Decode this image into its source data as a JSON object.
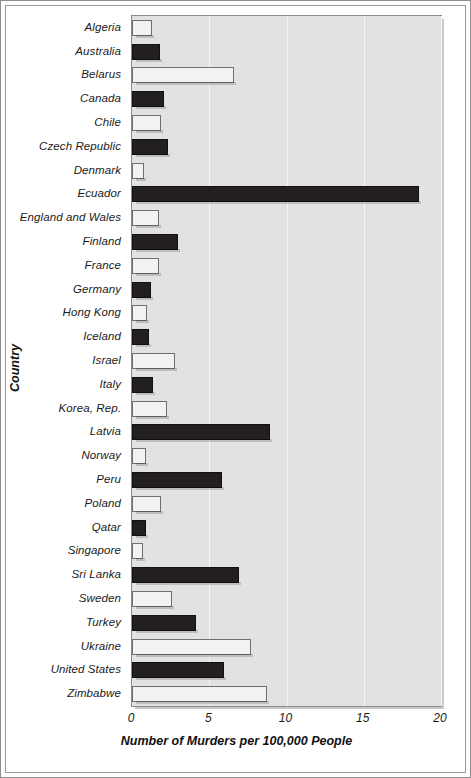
{
  "chart_data": {
    "type": "bar",
    "orientation": "horizontal",
    "title": "",
    "xlabel": "Number of Murders per 100,000 People",
    "ylabel": "Country",
    "xlim": [
      0,
      20
    ],
    "xticks": [
      0,
      5,
      10,
      15,
      20
    ],
    "xtick_labels": [
      "0",
      "5",
      "10",
      "15",
      "20"
    ],
    "grid": true,
    "grid_axis": "x",
    "legend": "none",
    "categories": [
      "Algeria",
      "Australia",
      "Belarus",
      "Canada",
      "Chile",
      "Czech Republic",
      "Denmark",
      "Ecuador",
      "England and Wales",
      "Finland",
      "France",
      "Germany",
      "Hong Kong",
      "Iceland",
      "Israel",
      "Italy",
      "Korea, Rep.",
      "Latvia",
      "Norway",
      "Peru",
      "Poland",
      "Qatar",
      "Singapore",
      "Sri Lanka",
      "Sweden",
      "Turkey",
      "Ukraine",
      "United States",
      "Zimbabwe"
    ],
    "values": [
      1.3,
      1.8,
      6.6,
      2.1,
      1.85,
      2.3,
      0.8,
      18.6,
      1.75,
      3.0,
      1.75,
      1.2,
      1.0,
      1.1,
      2.8,
      1.35,
      2.25,
      8.9,
      0.9,
      5.8,
      1.9,
      0.9,
      0.7,
      6.95,
      2.6,
      4.15,
      7.7,
      5.95,
      8.75
    ],
    "bar_styles": [
      "light",
      "dark",
      "light",
      "dark",
      "light",
      "dark",
      "light",
      "dark",
      "light",
      "dark",
      "light",
      "dark",
      "light",
      "dark",
      "light",
      "dark",
      "light",
      "dark",
      "light",
      "dark",
      "light",
      "dark",
      "light",
      "dark",
      "light",
      "dark",
      "light",
      "dark",
      "light"
    ],
    "colors": {
      "bar_dark": "#231f20",
      "bar_light": "#f2f2f2",
      "plot_background": "#e2e2e2",
      "gridline": "#f4f4f4",
      "axis": "#8a8a8a",
      "text": "#1a1a1a"
    }
  }
}
